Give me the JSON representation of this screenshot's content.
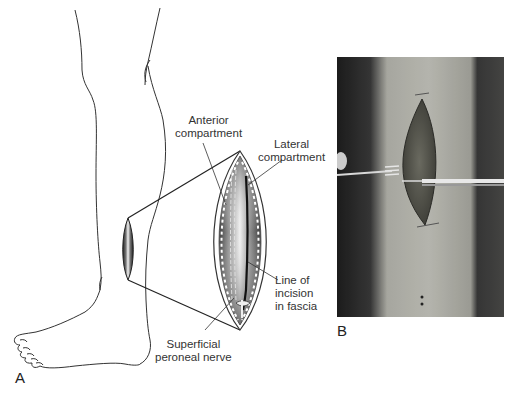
{
  "figure": {
    "panel_a": {
      "letter": "A",
      "labels": {
        "anterior_compartment": [
          "Anterior",
          "compartment"
        ],
        "lateral_compartment": [
          "Lateral",
          "compartment"
        ],
        "line_of_incision": [
          "Line of",
          "incision",
          "in fascia"
        ],
        "superficial_peroneal_nerve": [
          "Superficial",
          "peroneal nerve"
        ]
      }
    },
    "panel_b": {
      "letter": "B"
    }
  },
  "colors": {
    "line": "#2a2a2a",
    "label_text": "#333333",
    "muscle_dark": "#3a3a3a",
    "muscle_light": "#e8e8e8",
    "photo_skin": "#b8b8b0",
    "photo_wound": "#4a4a44",
    "photo_bg": "#2a2a2a"
  }
}
